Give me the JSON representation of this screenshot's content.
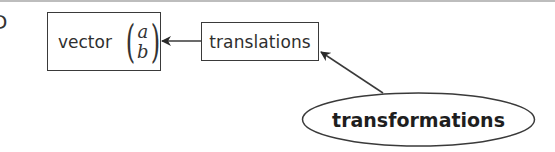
{
  "diagram": {
    "edge_glyph": "D",
    "nodes": {
      "vector": {
        "label": "vector",
        "matrix": {
          "top": "a",
          "bottom": "b",
          "open_paren": "(",
          "close_paren": ")"
        },
        "shape": "rectangle"
      },
      "translations": {
        "label": "translations",
        "shape": "rectangle"
      },
      "transformations": {
        "label": "transformations",
        "shape": "ellipse"
      }
    },
    "edges": [
      {
        "from": "translations",
        "to": "vector",
        "style": "arrow"
      },
      {
        "from": "transformations",
        "to": "translations",
        "style": "arrow"
      }
    ],
    "colors": {
      "stroke": "#3a3a3a",
      "text": "#2f2f2f",
      "top_rule": "#bdbdbd",
      "background": "#ffffff"
    }
  }
}
